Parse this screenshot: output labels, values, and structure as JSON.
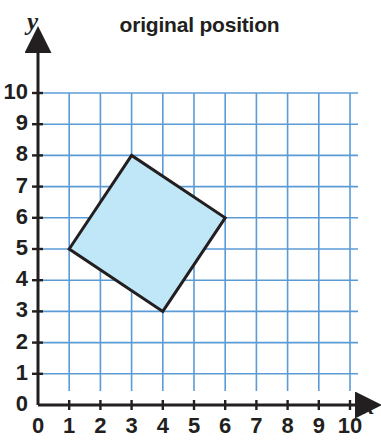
{
  "chart_data": {
    "type": "scatter",
    "title": "original position",
    "xlabel": "x",
    "ylabel": "y",
    "xlim": [
      0,
      10
    ],
    "ylim": [
      0,
      10
    ],
    "xticks": [
      "0",
      "1",
      "2",
      "3",
      "4",
      "5",
      "6",
      "7",
      "8",
      "9",
      "10"
    ],
    "yticks": [
      "0",
      "1",
      "2",
      "3",
      "4",
      "5",
      "6",
      "7",
      "8",
      "9",
      "10"
    ],
    "grid": true,
    "legend": false,
    "shapes": [
      {
        "name": "original-position-square",
        "kind": "polygon",
        "vertices": [
          [
            1,
            5
          ],
          [
            3,
            8
          ],
          [
            6,
            6
          ],
          [
            4,
            3
          ]
        ],
        "fill": "#bfe7f7",
        "stroke": "#231f20",
        "stroke_width": 3
      }
    ],
    "colors": {
      "grid": "#5b9bd5",
      "axis": "#231f20",
      "shape_fill": "#bfe7f7",
      "shape_stroke": "#231f20",
      "text": "#231f20",
      "background": "#ffffff"
    }
  }
}
